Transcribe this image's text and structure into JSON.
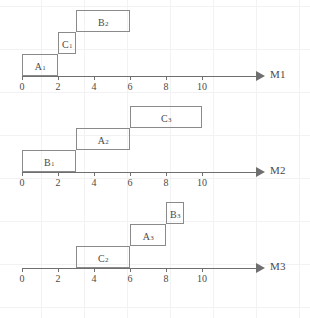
{
  "figure": {
    "type": "gantt-schedule",
    "axis_tick_values": [
      0,
      2,
      4,
      6,
      8,
      10
    ],
    "unit_px": 18,
    "origin_x_px": 22,
    "colors": {
      "axis": "#6f6f6f",
      "box_stroke": "#8a8a8a",
      "text": "#4a4a4a",
      "grid": "#f2f2f4",
      "background": "#ffffff"
    }
  },
  "chart_data": {
    "type": "bar",
    "title": "",
    "xlabel": "",
    "ylabel": "",
    "xlim": [
      0,
      12
    ],
    "grid": true,
    "legend": "none",
    "categories": [
      "M1",
      "M2",
      "M3"
    ],
    "series": [
      {
        "name": "M1",
        "values": [
          {
            "label": "A",
            "sub": "1",
            "start": 0,
            "end": 2,
            "duration": 2,
            "level": 0
          },
          {
            "label": "C",
            "sub": "1",
            "start": 2,
            "end": 3,
            "duration": 1,
            "level": 1
          },
          {
            "label": "B",
            "sub": "2",
            "start": 3,
            "end": 6,
            "duration": 3,
            "level": 2
          }
        ]
      },
      {
        "name": "M2",
        "values": [
          {
            "label": "B",
            "sub": "1",
            "start": 0,
            "end": 3,
            "duration": 3,
            "level": 0
          },
          {
            "label": "A",
            "sub": "2",
            "start": 3,
            "end": 6,
            "duration": 3,
            "level": 1
          },
          {
            "label": "C",
            "sub": "3",
            "start": 6,
            "end": 10,
            "duration": 4,
            "level": 2
          }
        ]
      },
      {
        "name": "M3",
        "values": [
          {
            "label": "C",
            "sub": "2",
            "start": 3,
            "end": 6,
            "duration": 3,
            "level": 0
          },
          {
            "label": "A",
            "sub": "3",
            "start": 6,
            "end": 8,
            "duration": 2,
            "level": 1
          },
          {
            "label": "B",
            "sub": "3",
            "start": 8,
            "end": 9,
            "duration": 1,
            "level": 2
          }
        ]
      }
    ]
  },
  "machines": [
    {
      "axis_name": "M1",
      "ticks": [
        "0",
        "2",
        "4",
        "6",
        "8",
        "10"
      ],
      "tasks": [
        {
          "name": "A",
          "subscript": "1",
          "start": 0,
          "end": 2,
          "level": 0
        },
        {
          "name": "C",
          "subscript": "1",
          "start": 2,
          "end": 3,
          "level": 1
        },
        {
          "name": "B",
          "subscript": "2",
          "start": 3,
          "end": 6,
          "level": 2
        }
      ]
    },
    {
      "axis_name": "M2",
      "ticks": [
        "0",
        "2",
        "4",
        "6",
        "8",
        "10"
      ],
      "tasks": [
        {
          "name": "B",
          "subscript": "1",
          "start": 0,
          "end": 3,
          "level": 0
        },
        {
          "name": "A",
          "subscript": "2",
          "start": 3,
          "end": 6,
          "level": 1
        },
        {
          "name": "C",
          "subscript": "3",
          "start": 6,
          "end": 10,
          "level": 2
        }
      ]
    },
    {
      "axis_name": "M3",
      "ticks": [
        "0",
        "2",
        "4",
        "6",
        "8",
        "10"
      ],
      "tasks": [
        {
          "name": "C",
          "subscript": "2",
          "start": 3,
          "end": 6,
          "level": 0
        },
        {
          "name": "A",
          "subscript": "3",
          "start": 6,
          "end": 8,
          "level": 1
        },
        {
          "name": "B",
          "subscript": "3",
          "start": 8,
          "end": 9,
          "level": 2
        }
      ]
    }
  ]
}
